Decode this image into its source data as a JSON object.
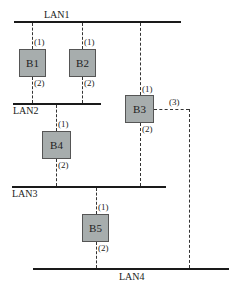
{
  "diagram": {
    "type": "network-topology",
    "lans": [
      {
        "id": "LAN1",
        "label": "LAN1"
      },
      {
        "id": "LAN2",
        "label": "LAN2"
      },
      {
        "id": "LAN3",
        "label": "LAN3"
      },
      {
        "id": "LAN4",
        "label": "LAN4"
      }
    ],
    "bridges": [
      {
        "id": "B1",
        "label": "B1",
        "ports": {
          "1": "(1)",
          "2": "(2)"
        }
      },
      {
        "id": "B2",
        "label": "B2",
        "ports": {
          "1": "(1)",
          "2": "(2)"
        }
      },
      {
        "id": "B3",
        "label": "B3",
        "ports": {
          "1": "(1)",
          "2": "(2)",
          "3": "(3)"
        }
      },
      {
        "id": "B4",
        "label": "B4",
        "ports": {
          "1": "(1)",
          "2": "(2)"
        }
      },
      {
        "id": "B5",
        "label": "B5",
        "ports": {
          "1": "(1)",
          "2": "(2)"
        }
      }
    ],
    "connections": [
      {
        "bridge": "B1",
        "port": "(1)",
        "lan": "LAN1"
      },
      {
        "bridge": "B1",
        "port": "(2)",
        "lan": "LAN2"
      },
      {
        "bridge": "B2",
        "port": "(1)",
        "lan": "LAN1"
      },
      {
        "bridge": "B2",
        "port": "(2)",
        "lan": "LAN2"
      },
      {
        "bridge": "B3",
        "port": "(1)",
        "lan": "LAN1"
      },
      {
        "bridge": "B3",
        "port": "(2)",
        "lan": "LAN3"
      },
      {
        "bridge": "B3",
        "port": "(3)",
        "lan": "LAN4"
      },
      {
        "bridge": "B4",
        "port": "(1)",
        "lan": "LAN2"
      },
      {
        "bridge": "B4",
        "port": "(2)",
        "lan": "LAN3"
      },
      {
        "bridge": "B5",
        "port": "(1)",
        "lan": "LAN3"
      },
      {
        "bridge": "B5",
        "port": "(2)",
        "lan": "LAN4"
      }
    ],
    "colors": {
      "bridge_fill": "#a7adad",
      "bridge_border": "#555555",
      "line": "#1a1a1a"
    }
  }
}
